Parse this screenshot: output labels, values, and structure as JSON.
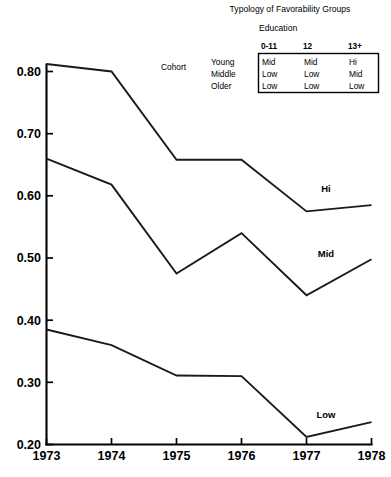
{
  "chart_data": {
    "type": "line",
    "title": "Typology of Favorability Groups",
    "xlabel": "",
    "ylabel": "",
    "x": [
      "1973",
      "1974",
      "1975",
      "1976",
      "1977",
      "1978"
    ],
    "xlim": [
      1973,
      1978
    ],
    "ylim": [
      0.2,
      0.8
    ],
    "yticks": [
      "0.20",
      "0.30",
      "0.40",
      "0.50",
      "0.60",
      "0.70",
      "0.80"
    ],
    "ytick_values": [
      0.2,
      0.3,
      0.4,
      0.5,
      0.6,
      0.7,
      0.8
    ],
    "xticks": [
      "1973",
      "1974",
      "1975",
      "1976",
      "1977",
      "1978"
    ],
    "grid": false,
    "legend_position": "inline-right",
    "series": [
      {
        "name": "Hi",
        "label": "Hi",
        "values": [
          0.812,
          0.8,
          0.658,
          0.658,
          0.575,
          0.585
        ]
      },
      {
        "name": "Mid",
        "label": "Mid",
        "values": [
          0.66,
          0.618,
          0.475,
          0.54,
          0.44,
          0.498
        ]
      },
      {
        "name": "Low",
        "label": "Low",
        "values": [
          0.385,
          0.36,
          0.311,
          0.31,
          0.212,
          0.236
        ]
      }
    ]
  },
  "legend": {
    "title": "Typology of Favorability Groups",
    "education_header": "Education",
    "cohort_header": "Cohort",
    "column_headers": [
      "0-11",
      "12",
      "13+"
    ],
    "row_headers": [
      "Young",
      "Middle",
      "Older"
    ],
    "cells": [
      [
        "Mid",
        "Mid",
        "Hi"
      ],
      [
        "Low",
        "Low",
        "Mid"
      ],
      [
        "Low",
        "Low",
        "Low"
      ]
    ]
  },
  "footnote": {
    "text": ""
  },
  "colors": {
    "line": "#1a1a1a",
    "axis": "#000000",
    "background": "#ffffff",
    "text": "#000000"
  }
}
